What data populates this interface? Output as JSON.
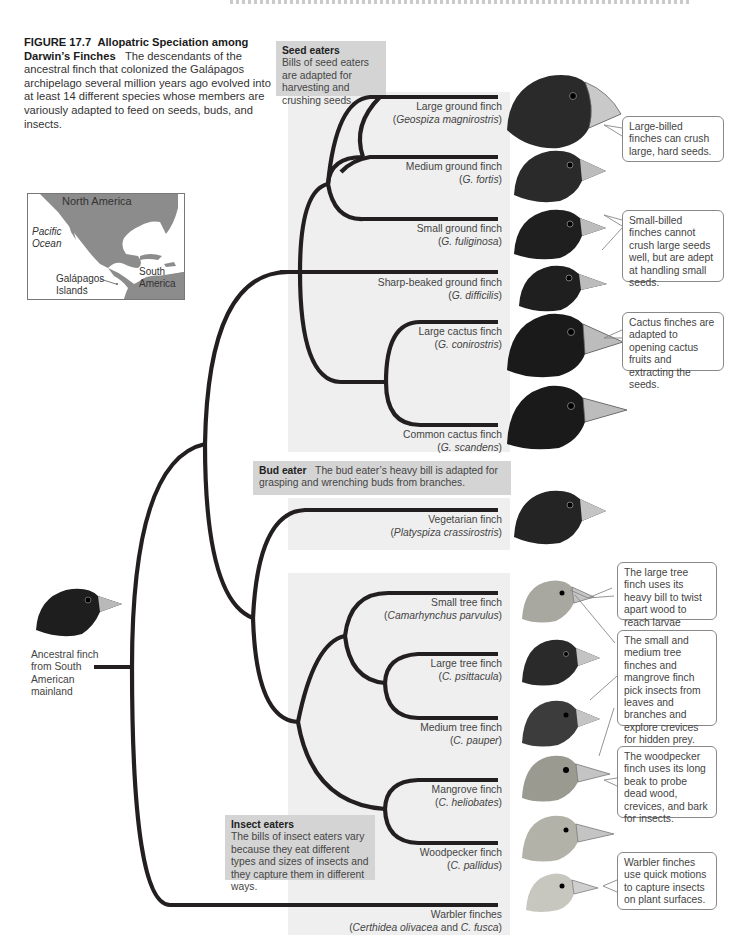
{
  "figure": {
    "number_label": "FIGURE 17.7",
    "title": "Allopatric Speciation among Darwin’s Finches",
    "caption": "The descendants of the ancestral finch that colonized the Galápagos archipelago several million years ago evolved into at least 14 different species whose members are variously adapted to feed on seeds, buds, and insects."
  },
  "map": {
    "labels": {
      "north_america": "North America",
      "pacific_ocean_1": "Pacific",
      "pacific_ocean_2": "Ocean",
      "galapagos_1": "Galápagos",
      "galapagos_2": "Islands",
      "south_america_1": "South",
      "south_america_2": "America"
    },
    "colors": {
      "land": "#8c8c8c",
      "water": "#ffffff"
    }
  },
  "ancestor": {
    "label_lines": [
      "Ancestral finch",
      "from South",
      "American",
      "mainland"
    ]
  },
  "groups": {
    "seed_eaters": {
      "title": "Seed eaters",
      "text": "Bills of seed eaters are adapted for harvesting and crushing seeds."
    },
    "bud_eater": {
      "title": "Bud eater",
      "text": "The bud eater’s heavy bill is adapted for grasping and wrenching buds from branches."
    },
    "insect_eaters": {
      "title": "Insect eaters",
      "text": "The bills of insect eaters vary because they eat different types and sizes of insects and they capture them in different ways."
    }
  },
  "species": [
    {
      "common": "Large ground finch",
      "sci_prefix": "(",
      "sci": "Geospiza magnirostris",
      "sci_suffix": ")"
    },
    {
      "common": "Medium ground finch",
      "sci_prefix": "(",
      "sci": "G. fortis",
      "sci_suffix": ")"
    },
    {
      "common": "Small ground finch",
      "sci_prefix": "(",
      "sci": "G. fuliginosa",
      "sci_suffix": ")"
    },
    {
      "common": "Sharp-beaked ground finch",
      "sci_prefix": "(",
      "sci": "G. difficilis",
      "sci_suffix": ")"
    },
    {
      "common": "Large cactus finch",
      "sci_prefix": "(",
      "sci": "G. conirostris",
      "sci_suffix": ")"
    },
    {
      "common": "Common cactus finch",
      "sci_prefix": "(",
      "sci": "G. scandens",
      "sci_suffix": ")"
    },
    {
      "common": "Vegetarian finch",
      "sci_prefix": "(",
      "sci": "Platyspiza crassirostris",
      "sci_suffix": ")"
    },
    {
      "common": "Small tree finch",
      "sci_prefix": "(",
      "sci": "Camarhynchus parvulus",
      "sci_suffix": ")"
    },
    {
      "common": "Large tree finch",
      "sci_prefix": "(",
      "sci": "C. psittacula",
      "sci_suffix": ")"
    },
    {
      "common": "Medium tree finch",
      "sci_prefix": "(",
      "sci": "C. pauper",
      "sci_suffix": ")"
    },
    {
      "common": "Mangrove finch",
      "sci_prefix": "(",
      "sci": "C. heliobates",
      "sci_suffix": ")"
    },
    {
      "common": "Woodpecker finch",
      "sci_prefix": "(",
      "sci": "C. pallidus",
      "sci_suffix": ")"
    },
    {
      "common": "Warbler finches",
      "sci_prefix": "(",
      "sci": "Certhidea olivacea",
      "sci_mid": " and ",
      "sci2": "C. fusca",
      "sci_suffix": ")"
    }
  ],
  "callouts": [
    {
      "text": "Large-billed finches can crush large, hard seeds."
    },
    {
      "text": "Small-billed finches cannot crush large seeds well, but are adept at handling small seeds."
    },
    {
      "text": "Cactus finches are adapted to opening cactus fruits and extracting the seeds."
    },
    {
      "text": "The large tree finch uses its heavy bill to twist apart wood to reach larvae inside."
    },
    {
      "text": "The small and medium tree finches and mangrove finch pick insects from leaves and branches and explore crevices for hidden prey."
    },
    {
      "text": "The woodpecker finch uses its long beak to probe dead wood, crevices, and bark for insects."
    },
    {
      "text": "Warbler finches use quick motions to capture insects on plant surfaces."
    }
  ],
  "colors": {
    "tree_line": "#231f20",
    "panel_bg": "#efefef",
    "tag_bg": "#d4d4d4",
    "dark_bird": "#1e1e1e",
    "light_bird": "#c9a990",
    "beak": "#b9b9b9"
  }
}
